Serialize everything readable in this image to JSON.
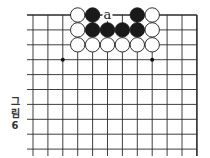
{
  "figure": {
    "caption_lines": [
      "그",
      "림",
      "6"
    ],
    "caption": "그림 6"
  },
  "board": {
    "origin_x": 33,
    "origin_y": 15,
    "spacing": 14.9,
    "columns": 12,
    "rows": 10,
    "edges": [
      "top",
      "right"
    ],
    "line_color": "#2a2a2a",
    "star_points": [
      [
        2,
        3
      ],
      [
        8,
        3
      ]
    ],
    "stones": [
      {
        "col": 3,
        "row": 0,
        "color": "white"
      },
      {
        "col": 4,
        "row": 0,
        "color": "black"
      },
      {
        "col": 7,
        "row": 0,
        "color": "black"
      },
      {
        "col": 8,
        "row": 0,
        "color": "white"
      },
      {
        "col": 3,
        "row": 1,
        "color": "white"
      },
      {
        "col": 4,
        "row": 1,
        "color": "black"
      },
      {
        "col": 5,
        "row": 1,
        "color": "black"
      },
      {
        "col": 6,
        "row": 1,
        "color": "black"
      },
      {
        "col": 7,
        "row": 1,
        "color": "black"
      },
      {
        "col": 8,
        "row": 1,
        "color": "white"
      },
      {
        "col": 3,
        "row": 2,
        "color": "white"
      },
      {
        "col": 4,
        "row": 2,
        "color": "white"
      },
      {
        "col": 5,
        "row": 2,
        "color": "white"
      },
      {
        "col": 6,
        "row": 2,
        "color": "white"
      },
      {
        "col": 7,
        "row": 2,
        "color": "white"
      },
      {
        "col": 8,
        "row": 2,
        "color": "white"
      }
    ],
    "labels": [
      {
        "col": 5,
        "row": 0,
        "text": "a"
      }
    ]
  }
}
